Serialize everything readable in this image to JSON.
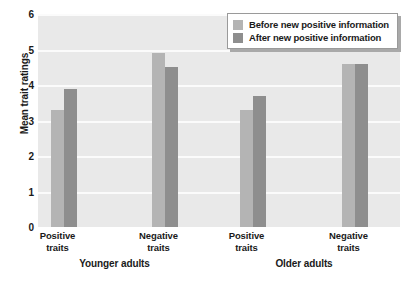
{
  "chart_data": {
    "type": "bar",
    "title": "",
    "xlabel": "",
    "ylabel": "Mean trait ratings",
    "ylim": [
      0,
      6
    ],
    "yticks": [
      0,
      1,
      2,
      3,
      4,
      5,
      6
    ],
    "grid": true,
    "legend_position": "top-right",
    "groups": [
      {
        "name": "Younger adults"
      },
      {
        "name": "Older adults"
      }
    ],
    "categories": [
      "Positive\ntraits",
      "Negative\ntraits",
      "Positive\ntraits",
      "Negative\ntraits"
    ],
    "category_lines": [
      {
        "line1": "Positive",
        "line2": "traits"
      },
      {
        "line1": "Negative",
        "line2": "traits"
      },
      {
        "line1": "Positive",
        "line2": "traits"
      },
      {
        "line1": "Negative",
        "line2": "traits"
      }
    ],
    "series": [
      {
        "name": "Before new positive information",
        "color": "#b4b4b4",
        "values": [
          3.3,
          4.9,
          3.3,
          4.6
        ]
      },
      {
        "name": "After new positive information",
        "color": "#8e8e8e",
        "values": [
          3.9,
          4.5,
          3.7,
          4.6
        ]
      }
    ]
  },
  "legend": {
    "items": [
      {
        "label": "Before new positive information",
        "swatch": "#b4b4b4"
      },
      {
        "label": "After new positive information",
        "swatch": "#8e8e8e"
      }
    ]
  },
  "axes": {
    "y_title": "Mean trait ratings",
    "y_tick_labels": [
      "6",
      "5",
      "4",
      "3",
      "2",
      "1",
      "0"
    ]
  },
  "colors": {
    "plot_background": "#e9e9e9",
    "gridline": "#fbfbfb",
    "series_before": "#b4b4b4",
    "series_after": "#8e8e8e",
    "text": "#1a1a1a"
  }
}
